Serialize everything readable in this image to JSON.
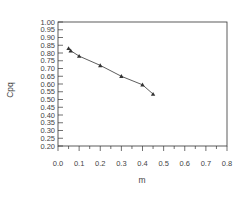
{
  "chart_data": {
    "type": "line",
    "title": "",
    "xlabel": "m",
    "ylabel": "Cpq",
    "xlim": [
      0.0,
      0.8
    ],
    "ylim": [
      0.2,
      1.0
    ],
    "x_ticks": [
      "0.0",
      "0.1",
      "0.2",
      "0.3",
      "0.4",
      "0.5",
      "0.6",
      "0.7",
      "0.8"
    ],
    "y_ticks": [
      "1.00",
      "0.95",
      "0.90",
      "0.85",
      "0.80",
      "0.75",
      "0.70",
      "0.65",
      "0.60",
      "0.55",
      "0.50",
      "0.45",
      "0.40",
      "0.35",
      "0.30",
      "0.25",
      "0.20"
    ],
    "grid": false,
    "legend": null,
    "series": [
      {
        "name": "Cpq",
        "marker": "triangle",
        "color": "#333333",
        "x": [
          0.05,
          0.06,
          0.1,
          0.2,
          0.3,
          0.4,
          0.45
        ],
        "y": [
          0.83,
          0.815,
          0.78,
          0.72,
          0.65,
          0.595,
          0.535
        ]
      }
    ]
  }
}
